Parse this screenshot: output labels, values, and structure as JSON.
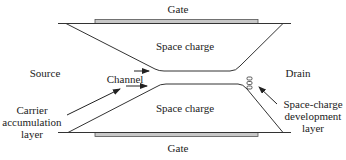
{
  "diagram": {
    "labels": {
      "gate_top": "Gate",
      "gate_bottom": "Gate",
      "space_charge_top": "Space charge",
      "space_charge_bottom": "Space charge",
      "source": "Source",
      "drain": "Drain",
      "channel": "Channel",
      "carrier_layer": [
        "Carrier",
        "accumulation",
        "layer"
      ],
      "space_charge_dev_layer": [
        "Space-charge",
        "development",
        "layer"
      ]
    },
    "colors": {
      "line": "#333333",
      "gate_fill": "#c8c8c8",
      "text": "#222222"
    }
  }
}
